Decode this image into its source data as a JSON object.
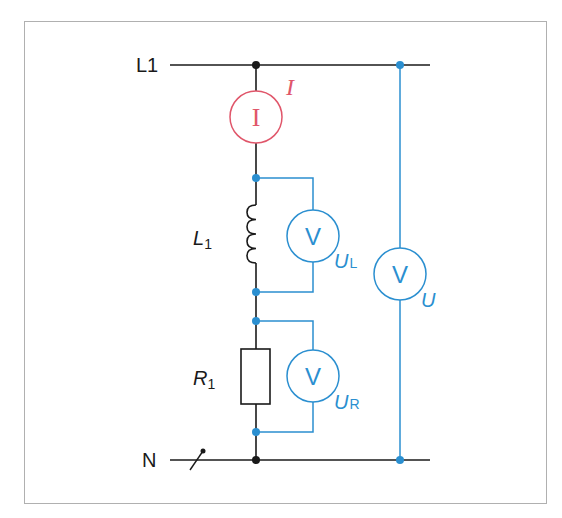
{
  "diagram": {
    "type": "circuit-schematic",
    "colors": {
      "wire": "#1a1a1a",
      "measurement": "#2b8fd0",
      "ammeter": "#e0566a",
      "frame": "#b0b0b0"
    },
    "conductors": {
      "line": "L1",
      "neutral": "N"
    },
    "components": {
      "ammeter": {
        "symbol": "I",
        "label": "I"
      },
      "inductor": {
        "label_main": "L",
        "label_sub": "1"
      },
      "resistor": {
        "label_main": "R",
        "label_sub": "1"
      },
      "voltmeter_inductor": {
        "symbol": "V",
        "label_main": "U",
        "label_sub": "L"
      },
      "voltmeter_resistor": {
        "symbol": "V",
        "label_main": "U",
        "label_sub": "R"
      },
      "voltmeter_total": {
        "symbol": "V",
        "label": "U"
      }
    }
  }
}
